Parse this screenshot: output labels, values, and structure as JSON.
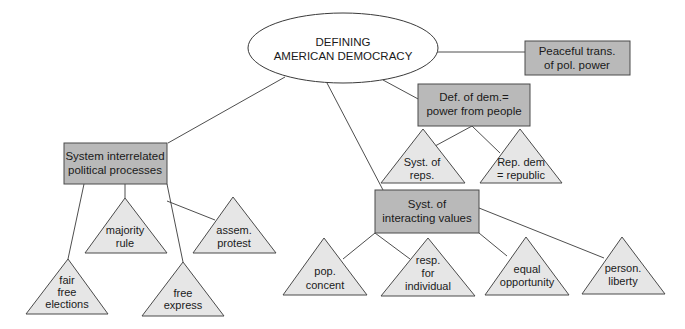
{
  "diagram": {
    "type": "concept-map",
    "colors": {
      "line": "#3a3a3a",
      "box_fill": "#b9b9b9",
      "box_stroke": "#4a4a4a",
      "triangle_fill": "#e6e6e6",
      "ellipse_fill": "#ffffff",
      "text": "#1a1a1a"
    },
    "root": {
      "lines": [
        "DEFINING",
        "AMERICAN DEMOCRACY"
      ]
    },
    "boxes": {
      "peaceful": {
        "lines": [
          "Peaceful trans.",
          "of pol. power"
        ]
      },
      "definition": {
        "lines": [
          "Def. of dem.=",
          "power from people"
        ]
      },
      "system": {
        "lines": [
          "System interrelated",
          "political processes"
        ]
      },
      "values": {
        "lines": [
          "Syst. of",
          "interacting values"
        ]
      }
    },
    "triangles": {
      "reps": {
        "lines": [
          "Syst. of",
          "reps."
        ]
      },
      "republic": {
        "lines": [
          "Rep. dem",
          "= republic"
        ]
      },
      "majority": {
        "lines": [
          "majority",
          "rule"
        ]
      },
      "assem": {
        "lines": [
          "assem.",
          "protest"
        ]
      },
      "elections": {
        "lines": [
          "fair",
          "free",
          "elections"
        ]
      },
      "express": {
        "lines": [
          "free",
          "express"
        ]
      },
      "consent": {
        "lines": [
          "pop.",
          "concent"
        ]
      },
      "responsibility": {
        "lines": [
          "resp.",
          "for",
          "individual"
        ]
      },
      "equality": {
        "lines": [
          "equal",
          "opportunity"
        ]
      },
      "liberty": {
        "lines": [
          "person.",
          "liberty"
        ]
      }
    }
  }
}
